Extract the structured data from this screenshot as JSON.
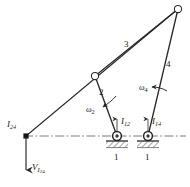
{
  "figure": {
    "background_color": "#ffffff",
    "line_color": "#262626",
    "centerline_color": "#6b6b6b",
    "hatch_color": "#4a4a4a",
    "joint_fill": "#ffffff"
  },
  "labels": {
    "link2": "2",
    "link3": "3",
    "link4": "4",
    "ground_left": "1",
    "ground_right": "1",
    "omega2_sym": "ω",
    "omega2_sub": "2",
    "omega4_sym": "ω",
    "omega4_sub": "4",
    "ic24_sym": "I",
    "ic24_sub": "24",
    "ic12_sym": "I",
    "ic12_sub": "12",
    "ic14_sym": "I",
    "ic14_sub": "14",
    "velocity_sym": "V",
    "velocity_sub_sym": "I",
    "velocity_sub_num": "24"
  },
  "geometry": {
    "pivot_top_right": {
      "x": 178,
      "y": 9,
      "r": 3.6
    },
    "pivot_mid": {
      "x": 95,
      "y": 76,
      "r": 3.6
    },
    "ground_pivot_left": {
      "x": 117,
      "y": 136,
      "r": 4.2
    },
    "ground_pivot_right": {
      "x": 148,
      "y": 136,
      "r": 4.2
    },
    "instant_center_24": {
      "x": 26,
      "y": 136,
      "r": 2.4
    },
    "centerline": {
      "x1": 24,
      "y1": 136,
      "x2": 186,
      "y2": 136
    },
    "link2": {
      "x1": 95,
      "y1": 76,
      "x2": 117,
      "y2": 136
    },
    "link3": {
      "x1": 95,
      "y1": 76,
      "x2": 178,
      "y2": 9
    },
    "link4": {
      "x1": 178,
      "y1": 9,
      "x2": 148,
      "y2": 136
    },
    "ray_ic24": {
      "x1": 26,
      "y1": 136,
      "x2": 178,
      "y2": 9
    },
    "velocity_arrow": {
      "x1": 26,
      "y1": 137,
      "x2": 26,
      "y2": 175
    }
  }
}
